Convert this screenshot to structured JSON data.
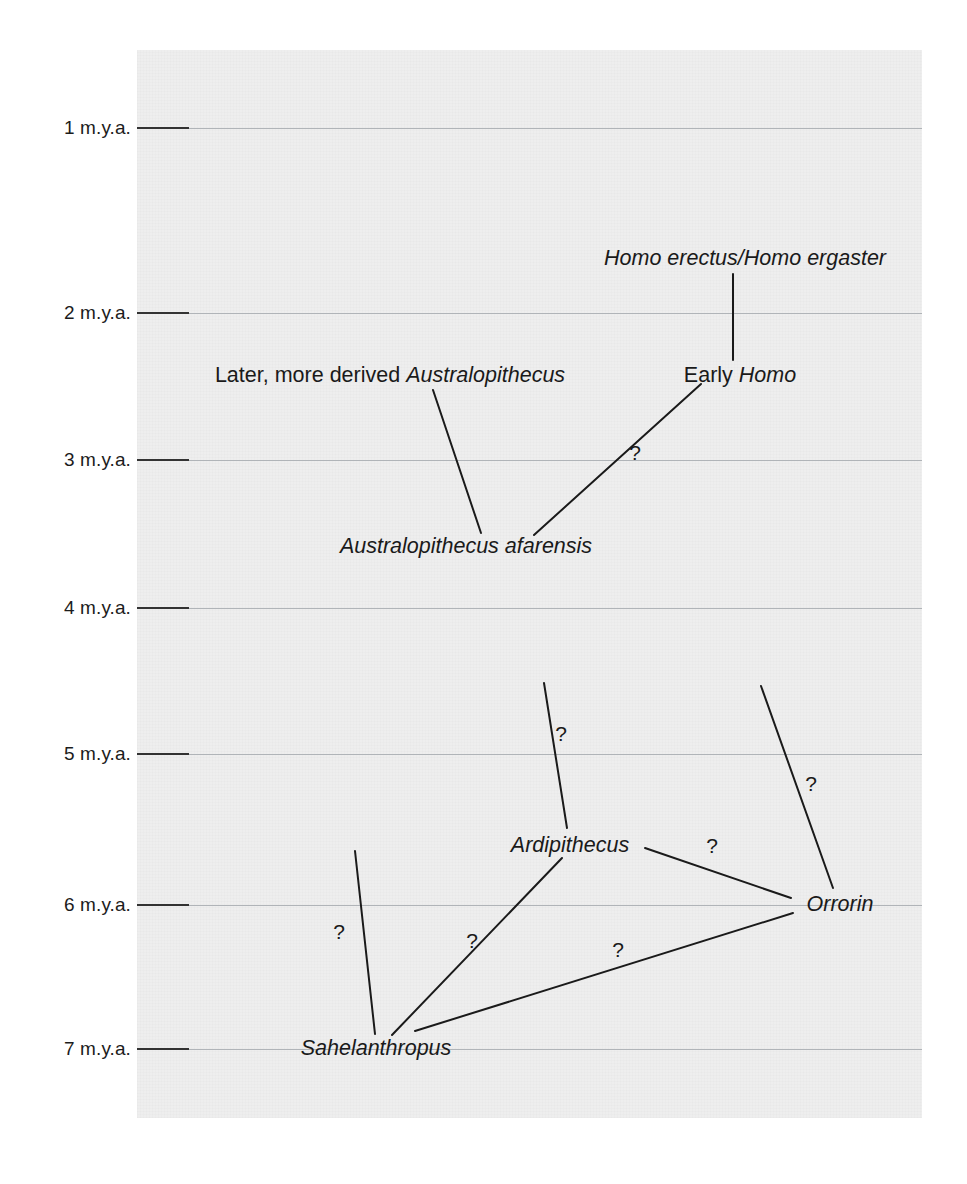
{
  "figure": {
    "type": "phylogeny-timeline",
    "background_color": "#ffffff",
    "panel_color": "#eeeeee",
    "line_color": "#1a1a1a",
    "gridline_color": "#b0b4b8",
    "gradient_top_color": "#f2f2f2",
    "gradient_bottom_color": "#6a6a6a"
  },
  "axis": {
    "title": "",
    "unit": "m.y.a.",
    "ticks": [
      {
        "label": "1 m.y.a.",
        "value": 1,
        "y": 128
      },
      {
        "label": "2 m.y.a.",
        "value": 2,
        "y": 313
      },
      {
        "label": "3 m.y.a.",
        "value": 3,
        "y": 460
      },
      {
        "label": "4 m.y.a.",
        "value": 4,
        "y": 608
      },
      {
        "label": "5 m.y.a.",
        "value": 5,
        "y": 754
      },
      {
        "label": "6 m.y.a.",
        "value": 6,
        "y": 905
      },
      {
        "label": "7 m.y.a.",
        "value": 7,
        "y": 1049
      }
    ]
  },
  "chart_data": {
    "type": "diagram",
    "title": "",
    "xlabel": "",
    "ylabel": "m.y.a.",
    "ylim": [
      0.6,
      7.5
    ],
    "grid": true,
    "legend": "none",
    "taxa": [
      {
        "id": "homo-erectus-ergaster",
        "text": "Homo erectus/Homo ergaster",
        "style": "italic",
        "age_mya": 2.2,
        "x": 745,
        "y": 259
      },
      {
        "id": "later-derived-australopithecus",
        "text": "Later, more derived Australopithecus",
        "roman_part": "Later, more derived ",
        "italic_part": "Australopithecus",
        "style": "mixed",
        "age_mya": 2.6,
        "x": 390,
        "y": 376
      },
      {
        "id": "early-homo",
        "text": "Early Homo",
        "roman_part": "Early ",
        "italic_part": "Homo",
        "style": "mixed",
        "age_mya": 2.6,
        "x": 740,
        "y": 376
      },
      {
        "id": "australopithecus-afarensis",
        "text": "Australopithecus afarensis",
        "style": "italic",
        "age_mya": 3.55,
        "x": 466,
        "y": 547
      },
      {
        "id": "ardipithecus",
        "text": "Ardipithecus",
        "style": "italic",
        "age_mya": 5.6,
        "x": 570,
        "y": 846
      },
      {
        "id": "orrorin",
        "text": "Orrorin",
        "style": "italic",
        "age_mya": 6.0,
        "x": 840,
        "y": 905
      },
      {
        "id": "sahelanthropus",
        "text": "Sahelanthropus",
        "style": "italic",
        "age_mya": 7.0,
        "x": 376,
        "y": 1049
      }
    ],
    "links": [
      {
        "id": "link-earlyhomo-to-erectus",
        "from": "early-homo",
        "to": "homo-erectus-ergaster",
        "uncertain": false,
        "x1": 733,
        "y1": 274,
        "x2": 733,
        "y2": 360
      },
      {
        "id": "link-afarensis-to-laterderived",
        "from": "australopithecus-afarensis",
        "to": "later-derived-australopithecus",
        "uncertain": false,
        "x1": 433,
        "y1": 390,
        "x2": 481,
        "y2": 533
      },
      {
        "id": "link-afarensis-to-earlyhomo",
        "from": "australopithecus-afarensis",
        "to": "early-homo",
        "uncertain": true,
        "x1": 534,
        "y1": 535,
        "x2": 701,
        "y2": 384
      },
      {
        "id": "link-ardipithecus-upward",
        "from": "ardipithecus",
        "to": "australopithecus-afarensis",
        "uncertain": true,
        "x1": 544,
        "y1": 683,
        "x2": 567,
        "y2": 828
      },
      {
        "id": "link-orrorin-upward",
        "from": "orrorin",
        "to": "australopithecus-afarensis",
        "uncertain": true,
        "x1": 761,
        "y1": 686,
        "x2": 833,
        "y2": 888
      },
      {
        "id": "link-ardipithecus-to-orrorin",
        "from": "ardipithecus",
        "to": "orrorin",
        "uncertain": true,
        "x1": 645,
        "y1": 848,
        "x2": 791,
        "y2": 898
      },
      {
        "id": "link-sahelanthropus-upward",
        "from": "sahelanthropus",
        "to": "ardipithecus",
        "uncertain": true,
        "x1": 355,
        "y1": 851,
        "x2": 375,
        "y2": 1034
      },
      {
        "id": "link-sahelanthropus-to-ardi",
        "from": "sahelanthropus",
        "to": "ardipithecus",
        "uncertain": true,
        "x1": 392,
        "y1": 1035,
        "x2": 562,
        "y2": 858
      },
      {
        "id": "link-sahelanthropus-to-orrorin",
        "from": "sahelanthropus",
        "to": "orrorin",
        "uncertain": true,
        "x1": 415,
        "y1": 1031,
        "x2": 793,
        "y2": 913
      }
    ],
    "uncertainty_marks": [
      {
        "id": "q-afarensis-earlyhomo",
        "label": "?",
        "x": 635,
        "y": 452
      },
      {
        "id": "q-ardipithecus-up",
        "label": "?",
        "x": 561,
        "y": 733
      },
      {
        "id": "q-orrorin-up",
        "label": "?",
        "x": 811,
        "y": 783
      },
      {
        "id": "q-ardi-orrorin",
        "label": "?",
        "x": 712,
        "y": 845
      },
      {
        "id": "q-sahel-up",
        "label": "?",
        "x": 339,
        "y": 931
      },
      {
        "id": "q-sahel-ardi",
        "label": "?",
        "x": 472,
        "y": 940
      },
      {
        "id": "q-sahel-orrorin",
        "label": "?",
        "x": 618,
        "y": 949
      }
    ]
  }
}
